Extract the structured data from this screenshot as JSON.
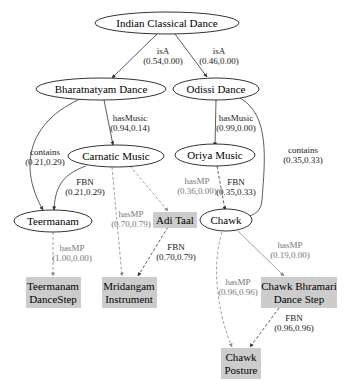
{
  "diagram": {
    "colors": {
      "ellipse_stroke": "#000000",
      "box_fill": "#cccccc",
      "edge_dark": "#333333",
      "edge_gray": "#888888",
      "label_gray": "#777777"
    },
    "nodes": [
      {
        "id": "indian-classical-dance",
        "label": "Indian Classical Dance",
        "shape": "ellipse"
      },
      {
        "id": "bharatnatyam-dance",
        "label": "Bharatnatyam Dance",
        "shape": "ellipse"
      },
      {
        "id": "odissi-dance",
        "label": "Odissi Dance",
        "shape": "ellipse"
      },
      {
        "id": "carnatic-music",
        "label": "Carnatic Music",
        "shape": "ellipse"
      },
      {
        "id": "oriya-music",
        "label": "Oriya Music",
        "shape": "ellipse"
      },
      {
        "id": "teermanam",
        "label": "Teermanam",
        "shape": "ellipse"
      },
      {
        "id": "chawk",
        "label": "Chawk",
        "shape": "ellipse"
      },
      {
        "id": "adi-taal",
        "label": "Adi Taal",
        "shape": "box"
      },
      {
        "id": "teermanam-dancestep",
        "label_line1": "Teermanam",
        "label_line2": "DanceStep",
        "shape": "box"
      },
      {
        "id": "mridangam-instrument",
        "label_line1": "Mridangam",
        "label_line2": "Instrument",
        "shape": "box"
      },
      {
        "id": "chawk-bhramari",
        "label_line1": "Chawk Bhramari",
        "label_line2": "Dance Step",
        "shape": "box"
      },
      {
        "id": "chawk-posture",
        "label_line1": "Chawk",
        "label_line2": "Posture",
        "shape": "box"
      }
    ],
    "edges": [
      {
        "from": "Indian Classical Dance",
        "to": "Bharatnatyam Dance",
        "relation": "isA",
        "score": "(0.54,0.00)",
        "style": "solid"
      },
      {
        "from": "Indian Classical Dance",
        "to": "Odissi Dance",
        "relation": "isA",
        "score": "(0.46,0.00)",
        "style": "solid"
      },
      {
        "from": "Bharatnatyam Dance",
        "to": "Carnatic Music",
        "relation": "hasMusic",
        "score": "(0.94,0.14)",
        "style": "solid"
      },
      {
        "from": "Bharatnatyam Dance",
        "to": "Teermanam",
        "relation": "contains",
        "score": "(0.21,0.29)",
        "style": "solid"
      },
      {
        "from": "Odissi Dance",
        "to": "Oriya Music",
        "relation": "hasMusic",
        "score": "(0.99,0.00)",
        "style": "solid"
      },
      {
        "from": "Odissi Dance",
        "to": "Chawk",
        "relation": "contains",
        "score": "(0.35,0.33)",
        "style": "solid"
      },
      {
        "from": "Carnatic Music",
        "to": "Teermanam",
        "relation": "FBN",
        "score": "(0.21,0.29)",
        "style": "solid"
      },
      {
        "from": "Carnatic Music",
        "to": "Adi Taal",
        "relation": "hasMP",
        "score": "(0.36,0.00)",
        "style": "dashed-gray"
      },
      {
        "from": "Carnatic Music",
        "to": "Mridangam Instrument",
        "relation": "hasMP",
        "score": "(0.70,0.79)",
        "style": "dashed-gray"
      },
      {
        "from": "Adi Taal",
        "to": "Mridangam Instrument",
        "relation": "FBN",
        "score": "(0.70,0.79)",
        "style": "dashed-dark"
      },
      {
        "from": "Oriya Music",
        "to": "Chawk",
        "relation": "FBN",
        "score": "(0.35,0.33)",
        "style": "dashed-dark"
      },
      {
        "from": "Teermanam",
        "to": "Teermanam DanceStep",
        "relation": "hasMP",
        "score": "(1.00,0.00)",
        "style": "dashed-gray"
      },
      {
        "from": "Chawk",
        "to": "Chawk Bhramari Dance Step",
        "relation": "hasMP",
        "score": "(0.19,0.00)",
        "style": "solid-gray"
      },
      {
        "from": "Chawk",
        "to": "Chawk Posture",
        "relation": "hasMP",
        "score": "(0.96,0.96)",
        "style": "dashed-gray"
      },
      {
        "from": "Chawk Bhramari Dance Step",
        "to": "Chawk Posture",
        "relation": "FBN",
        "score": "(0.96,0.96)",
        "style": "dashed-dark"
      }
    ]
  }
}
